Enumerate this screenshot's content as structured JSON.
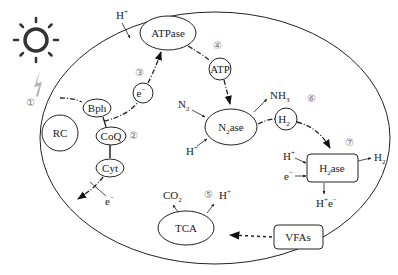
{
  "diagram": {
    "title": "",
    "colors": {
      "stroke": "#222222",
      "sun": "#333333",
      "lightning": "#b0b0b0",
      "step_number": "#888888",
      "background": "#ffffff"
    },
    "cell": {
      "shape": "ellipse",
      "cx": 215,
      "cy": 138,
      "rx": 175,
      "ry": 126
    },
    "light_source": {
      "icon": "sun-icon",
      "beam_icon": "lightning-icon"
    },
    "nodes": {
      "rc": {
        "label": "RC",
        "shape": "circle"
      },
      "bph": {
        "label": "Bph",
        "shape": "ellipse"
      },
      "coq": {
        "label": "CoQ",
        "shape": "ellipse"
      },
      "cyt": {
        "label": "Cyt",
        "shape": "ellipse"
      },
      "e_minus": {
        "label": "e",
        "sup": "−",
        "shape": "circle"
      },
      "atpase": {
        "label": "ATPase",
        "shape": "ellipse"
      },
      "atp": {
        "label": "ATP",
        "shape": "circle"
      },
      "n2ase": {
        "label": "N",
        "sub": "2",
        "tail": "ase",
        "shape": "ellipse"
      },
      "h2": {
        "label": "H",
        "sub": "2",
        "shape": "circle"
      },
      "h2ase": {
        "label": "H",
        "sub": "2",
        "tail": "ase",
        "shape": "rounded-rect"
      },
      "tca": {
        "label": "TCA",
        "shape": "ellipse"
      },
      "vfas": {
        "label": "VFAs",
        "shape": "rounded-rect"
      }
    },
    "labels": {
      "h_plus_top": {
        "base": "H",
        "sup": "+"
      },
      "n2_in": {
        "base": "N",
        "sub": "2"
      },
      "nh3_out": {
        "base": "NH",
        "sub": "3"
      },
      "h_plus_n2ase": {
        "base": "H",
        "sup": "+"
      },
      "e_minus_cyt": {
        "base": "e",
        "sup": "−"
      },
      "h_plus_h2ase": {
        "base": "H",
        "sup": "+"
      },
      "e_minus_h2ase": {
        "base": "e",
        "sup": "−"
      },
      "h2_out": {
        "base": "H",
        "sub": "2"
      },
      "h_plus_e_minus_out": {
        "base1": "H",
        "sup1": "+",
        "base2": "e",
        "sup2": "−"
      },
      "co2_out": {
        "base": "CO",
        "sub": "2"
      },
      "h_plus_tca": {
        "base": "H",
        "sup": "+"
      }
    },
    "step_numbers": {
      "s1": "①",
      "s2": "②",
      "s3": "③",
      "s4": "④",
      "s5": "⑤",
      "s6": "⑥",
      "s7": "⑦"
    },
    "edges": [
      {
        "from": "light",
        "to": "bph",
        "style": "dash-dot"
      },
      {
        "from": "bph",
        "to": "coq",
        "style": "dash-dot"
      },
      {
        "from": "coq",
        "to": "e_minus",
        "style": "dash-dot"
      },
      {
        "from": "e_minus",
        "to": "atpase",
        "style": "dash-dot",
        "arrow": true
      },
      {
        "from": "coq",
        "to": "cyt",
        "style": "solid"
      },
      {
        "from": "cyt",
        "to": "outside",
        "style": "dash-dot",
        "arrow": true
      },
      {
        "from": "atpase",
        "to": "atp",
        "style": "dash-dot"
      },
      {
        "from": "atp",
        "to": "n2ase",
        "style": "dash-dot",
        "arrow": true
      },
      {
        "from": "n2ase",
        "to": "h2",
        "style": "dash-dot"
      },
      {
        "from": "h2",
        "to": "h2ase",
        "style": "dash-dot",
        "arrow": true
      },
      {
        "from": "vfas",
        "to": "tca",
        "style": "dotted",
        "arrow": true
      }
    ]
  }
}
